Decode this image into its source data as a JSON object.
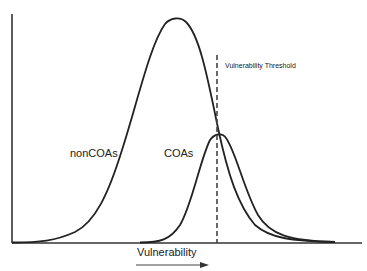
{
  "diagram": {
    "type": "overlapping-distributions",
    "x_axis_label": "Vulnerability",
    "x_axis_direction": "increasing-right-arrow",
    "threshold_label": "Vulnerability Threshold",
    "curves": [
      {
        "name": "nonCOAs",
        "label": "nonCOAs",
        "peak_position": "left",
        "relative_height": "tall"
      },
      {
        "name": "COAs",
        "label": "COAs",
        "peak_position": "at-threshold",
        "relative_height": "short"
      }
    ],
    "colors": {
      "line": "#222222",
      "dashed_line": "#444444",
      "background": "#ffffff"
    }
  }
}
